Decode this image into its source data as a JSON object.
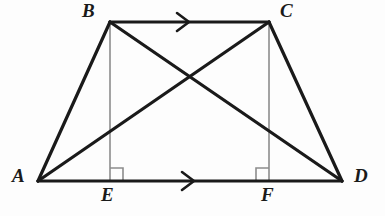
{
  "figure": {
    "type": "geometry-diagram",
    "shape": "trapezoid-with-diagonals-and-altitudes",
    "width": 385,
    "height": 216,
    "background_color": "#fdfdfd",
    "stroke_color": "#1a1a1a",
    "altitude_color": "#8c8c8c",
    "stroke_width_main": 3.2,
    "stroke_width_altitude": 1.6,
    "stroke_width_marker": 1.6
  },
  "points": {
    "A": {
      "label": "A",
      "x": 38,
      "y": 181
    },
    "B": {
      "label": "B",
      "x": 110,
      "y": 22
    },
    "C": {
      "label": "C",
      "x": 269,
      "y": 22
    },
    "D": {
      "label": "D",
      "x": 342,
      "y": 181
    },
    "E": {
      "label": "E",
      "x": 110,
      "y": 181
    },
    "F": {
      "label": "F",
      "x": 269,
      "y": 181
    }
  },
  "segments": [
    {
      "name": "side-AB",
      "from": "A",
      "to": "B",
      "style": "solid-bold"
    },
    {
      "name": "side-BC",
      "from": "B",
      "to": "C",
      "style": "solid-bold"
    },
    {
      "name": "side-CD",
      "from": "C",
      "to": "D",
      "style": "solid-bold"
    },
    {
      "name": "side-AD",
      "from": "A",
      "to": "D",
      "style": "solid-bold"
    },
    {
      "name": "diagonal-AC",
      "from": "A",
      "to": "C",
      "style": "solid-bold"
    },
    {
      "name": "diagonal-BD",
      "from": "B",
      "to": "D",
      "style": "solid-bold"
    },
    {
      "name": "altitude-BE",
      "from": "B",
      "to": "E",
      "style": "thin-gray"
    },
    {
      "name": "altitude-CF",
      "from": "C",
      "to": "F",
      "style": "thin-gray"
    }
  ],
  "markers": {
    "parallel_arrows": [
      {
        "name": "parallel-arrow-BC",
        "on": "side-BC",
        "x": 185,
        "y": 22,
        "direction": "right"
      },
      {
        "name": "parallel-arrow-AD",
        "on": "side-AD",
        "x": 190,
        "y": 181,
        "direction": "right"
      }
    ],
    "right_angles": [
      {
        "name": "right-angle-E",
        "at": "E",
        "x": 110,
        "y": 181,
        "opens": "right",
        "size": 13
      },
      {
        "name": "right-angle-F",
        "at": "F",
        "x": 269,
        "y": 181,
        "opens": "left",
        "size": 13
      }
    ],
    "diagonal_intersection": {
      "name": "diagonal-intersection",
      "x": 188,
      "y": 77
    }
  },
  "labels": {
    "A": "A",
    "B": "B",
    "C": "C",
    "D": "D",
    "E": "E",
    "F": "F"
  }
}
